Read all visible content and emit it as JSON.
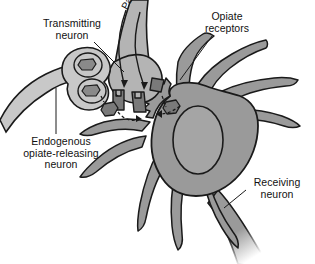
{
  "figure": {
    "background_color": "#ffffff",
    "line_color": "#1a1a1a",
    "colors": {
      "cell_body_fill": "#9a9a9a",
      "nucleus_fill": "#a5a5a5",
      "dendrite_fill": "#9a9a9a",
      "transmitting_fill": "#b4b4b4",
      "endogenous_fill": "#c8c8c8",
      "vesicle_fill": "#b0b0b0",
      "molecule_fill": "#6e6e6e",
      "receptor_fill": "#7a7a7a"
    }
  },
  "labels": {
    "transmitting_neuron": "Transmitting\nneuron",
    "opiate_receptors": "Opiate\nreceptors",
    "endogenous_neuron": "Endogenous\nopiate-releasing\nneuron",
    "receiving_neuron": "Receiving\nneuron",
    "pain": "Pain"
  }
}
